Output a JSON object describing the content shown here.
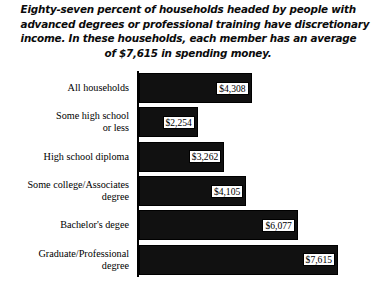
{
  "figure": {
    "title_lines": [
      "Eighty-seven percent of households headed by people with",
      "advanced degrees or professional training have discretionary",
      "income. In these households, each member has an average",
      "of $7,615 in spending money."
    ]
  },
  "chart_data": {
    "type": "bar",
    "orientation": "horizontal",
    "xlabel": "",
    "ylabel": "",
    "xlim": [
      0,
      7615
    ],
    "grid": false,
    "legend": false,
    "bar_color": "#111111",
    "value_label_prefix": "$",
    "categories": [
      "All households",
      "Some high school or less",
      "High school diploma",
      "Some college/Associates degree",
      "Bachelor's degee",
      "Graduate/Professional degree"
    ],
    "category_lines": [
      [
        "All households",
        ""
      ],
      [
        "Some high school",
        "or less"
      ],
      [
        "High school diploma",
        ""
      ],
      [
        "Some college/Associates",
        "degree"
      ],
      [
        "Bachelor's degee",
        ""
      ],
      [
        "Graduate/Professional",
        "degree"
      ]
    ],
    "values": [
      4308,
      2254,
      3262,
      4105,
      6077,
      7615
    ],
    "value_labels": [
      "$4,308",
      "$2,254",
      "$3,262",
      "$4,105",
      "$6,077",
      "$7,615"
    ]
  }
}
